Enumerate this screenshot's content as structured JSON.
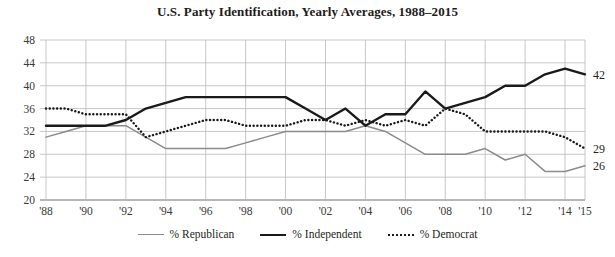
{
  "chart_data": {
    "type": "line",
    "title": "U.S. Party Identification, Yearly Averages, 1988–2015",
    "xlabel": "",
    "ylabel": "",
    "ylim": [
      20,
      48
    ],
    "ytick_step": 4,
    "yticks": [
      "20",
      "24",
      "28",
      "32",
      "36",
      "40",
      "44",
      "48"
    ],
    "xlim": [
      1988,
      2015
    ],
    "xticks": [
      "'88",
      "'90",
      "'92",
      "'94",
      "'96",
      "'98",
      "'00",
      "'02",
      "'04",
      "'06",
      "'08",
      "'10",
      "'12",
      "'14",
      "'15"
    ],
    "xtick_years": [
      1988,
      1990,
      1992,
      1994,
      1996,
      1998,
      2000,
      2002,
      2004,
      2006,
      2008,
      2010,
      2012,
      2014,
      2015
    ],
    "grid": true,
    "legend_position": "bottom",
    "x": [
      1988,
      1989,
      1990,
      1991,
      1992,
      1993,
      1994,
      1995,
      1996,
      1997,
      1998,
      1999,
      2000,
      2001,
      2002,
      2003,
      2004,
      2005,
      2006,
      2007,
      2008,
      2009,
      2010,
      2011,
      2012,
      2013,
      2014,
      2015
    ],
    "series": [
      {
        "name": "% Republican",
        "color": "#8b8b8b",
        "style": "solid-thin",
        "end_label": "26",
        "values": [
          31,
          32,
          33,
          33,
          33,
          31,
          29,
          29,
          29,
          29,
          30,
          31,
          32,
          32,
          32,
          32,
          33,
          32,
          30,
          28,
          28,
          28,
          29,
          27,
          28,
          25,
          25,
          26
        ]
      },
      {
        "name": "% Independent",
        "color": "#1a1a1a",
        "style": "solid-thick",
        "end_label": "42",
        "values": [
          33,
          33,
          33,
          33,
          34,
          36,
          37,
          38,
          38,
          38,
          38,
          38,
          38,
          36,
          34,
          36,
          33,
          35,
          35,
          39,
          36,
          37,
          38,
          40,
          40,
          42,
          43,
          42
        ]
      },
      {
        "name": "% Democrat",
        "color": "#1a1a1a",
        "style": "dotted",
        "end_label": "29",
        "values": [
          36,
          36,
          35,
          35,
          35,
          31,
          32,
          33,
          34,
          34,
          33,
          33,
          33,
          34,
          34,
          33,
          34,
          33,
          34,
          33,
          36,
          35,
          32,
          32,
          32,
          32,
          31,
          29
        ]
      }
    ]
  },
  "legend": {
    "items": [
      {
        "label": "% Republican",
        "swatch": "sw-republican"
      },
      {
        "label": "% Independent",
        "swatch": "sw-independent"
      },
      {
        "label": "% Democrat",
        "swatch": "sw-democrat"
      }
    ]
  }
}
